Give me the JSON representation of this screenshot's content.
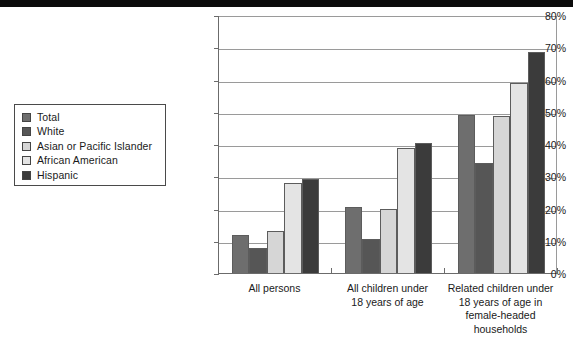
{
  "chart_data": {
    "type": "bar",
    "title": "",
    "xlabel": "",
    "ylabel": "",
    "ylim": [
      0,
      80
    ],
    "ytick_step": 10,
    "grid": true,
    "legend_position": "left-outside",
    "categories": [
      "All persons",
      "All children under\n18 years of age",
      "Related children under\n18 years of age in\nfemale-headed\nhouseholds"
    ],
    "yticks": [
      "0%",
      "10%",
      "20%",
      "30%",
      "40%",
      "50%",
      "60%",
      "70%",
      "80%"
    ],
    "series": [
      {
        "name": "Total",
        "color": "#6e6e6e",
        "values": [
          11.7,
          20.6,
          49.1
        ]
      },
      {
        "name": "White",
        "color": "#565656",
        "values": [
          7.7,
          10.4,
          34.1
        ]
      },
      {
        "name": "Asian or Pacific Islander",
        "color": "#d6d6d6",
        "values": [
          13.1,
          19.8,
          48.8
        ]
      },
      {
        "name": "African American",
        "color": "#e4e4e4",
        "values": [
          27.8,
          38.9,
          58.8
        ]
      },
      {
        "name": "Hispanic",
        "color": "#3b3b3b",
        "values": [
          29.2,
          40.4,
          68.6
        ]
      }
    ]
  },
  "legend": {
    "items": [
      {
        "label": "Total"
      },
      {
        "label": "White"
      },
      {
        "label": "Asian or Pacific Islander"
      },
      {
        "label": "African American"
      },
      {
        "label": "Hispanic"
      }
    ]
  }
}
